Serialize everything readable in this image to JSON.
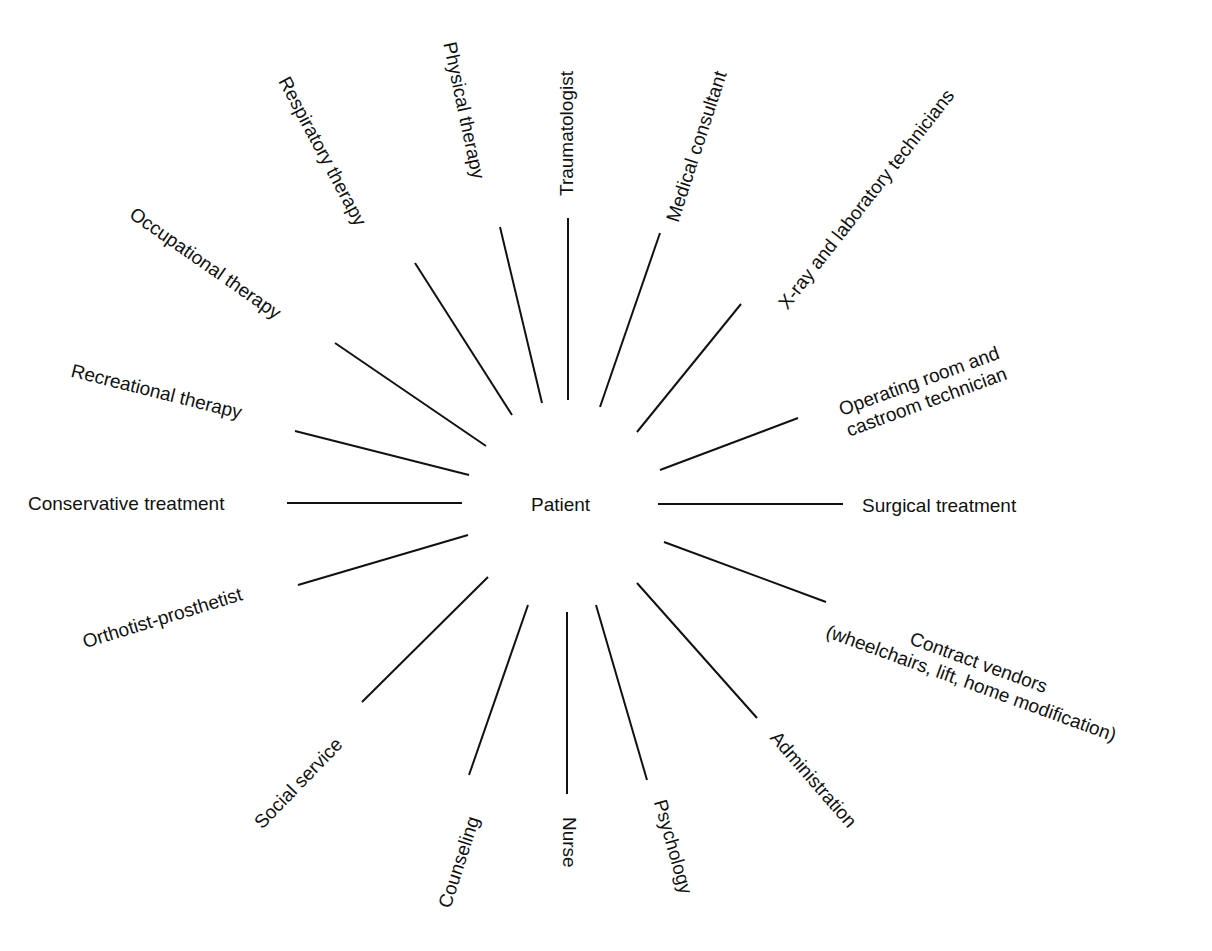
{
  "diagram": {
    "center": "Patient",
    "nodes": [
      {
        "id": "traumatologist",
        "label": "Traumatologist"
      },
      {
        "id": "medical-consultant",
        "label": "Medical consultant"
      },
      {
        "id": "xray-lab",
        "label": "X-ray and laboratory technicians"
      },
      {
        "id": "operating-room",
        "label": "Operating room and\ncastroom technician"
      },
      {
        "id": "surgical",
        "label": "Surgical treatment"
      },
      {
        "id": "contract-vendors",
        "label": "Contract vendors\n(wheelchairs, lift, home modification)"
      },
      {
        "id": "administration",
        "label": "Administration"
      },
      {
        "id": "psychology",
        "label": "Psychology"
      },
      {
        "id": "nurse",
        "label": "Nurse"
      },
      {
        "id": "counseling",
        "label": "Counseling"
      },
      {
        "id": "social-service",
        "label": "Social service"
      },
      {
        "id": "orthotist",
        "label": "Orthotist-prosthetist"
      },
      {
        "id": "conservative",
        "label": "Conservative treatment"
      },
      {
        "id": "recreational",
        "label": "Recreational therapy"
      },
      {
        "id": "occupational",
        "label": "Occupational therapy"
      },
      {
        "id": "respiratory",
        "label": "Respiratory therapy"
      },
      {
        "id": "physical",
        "label": "Physical therapy"
      }
    ]
  }
}
